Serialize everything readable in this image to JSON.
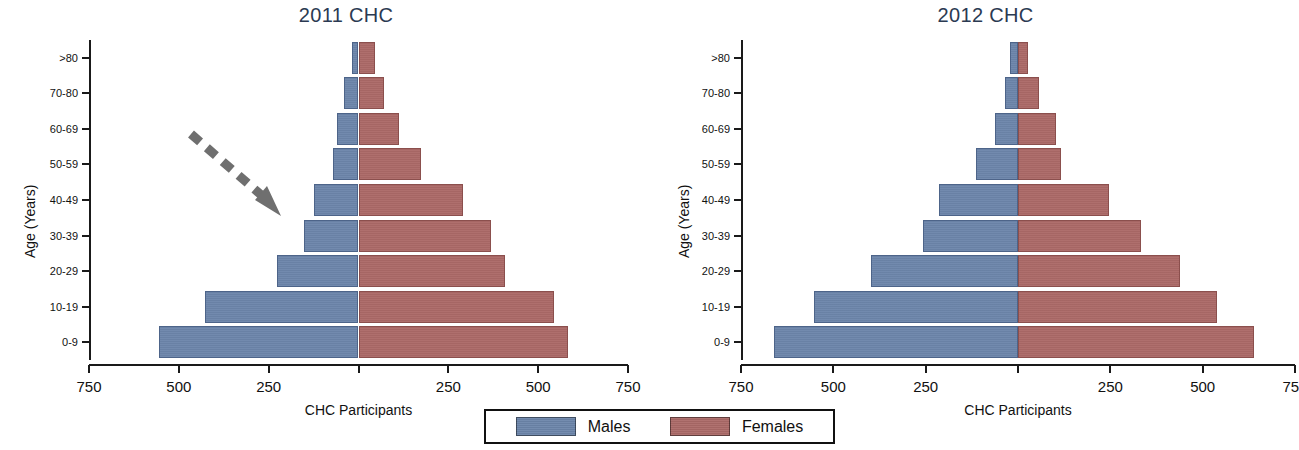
{
  "figure": {
    "xlabel": "CHC Participants",
    "ylabel": "Age (Years)"
  },
  "legend": {
    "items": [
      {
        "label": "Males",
        "color": "#6d86ab"
      },
      {
        "label": "Females",
        "color": "#ac6a68"
      }
    ]
  },
  "annotation": {
    "arrow": "dashed-arrow-pointing-down-right"
  },
  "panels": [
    {
      "title": "2011 CHC"
    },
    {
      "title": "2012 CHC"
    }
  ],
  "chart_data": [
    {
      "type": "bar",
      "title": "2011 CHC",
      "subtype": "population-pyramid",
      "xlabel": "CHC Participants",
      "ylabel": "Age (Years)",
      "categories": [
        "0-9",
        "10-19",
        "20-29",
        "30-39",
        "40-49",
        "50-59",
        "60-69",
        "70-80",
        ">80"
      ],
      "xticks": [
        750,
        500,
        250,
        0,
        250,
        500,
        750
      ],
      "xtick_labels": [
        "750",
        "500",
        "250",
        "",
        "250",
        "500",
        "750"
      ],
      "xlim": [
        -750,
        750
      ],
      "grid": false,
      "series": [
        {
          "name": "Males",
          "color": "#6d86ab",
          "side": "left",
          "values": [
            554,
            426,
            228,
            153,
            125,
            72,
            61,
            39,
            17
          ]
        },
        {
          "name": "Females",
          "color": "#ac6a68",
          "side": "right",
          "values": [
            582,
            543,
            407,
            368,
            290,
            175,
            114,
            70,
            45
          ]
        }
      ]
    },
    {
      "type": "bar",
      "title": "2012 CHC",
      "subtype": "population-pyramid",
      "xlabel": "CHC Participants",
      "ylabel": "Age (Years)",
      "categories": [
        "0-9",
        "10-19",
        "20-29",
        "30-39",
        "40-49",
        "50-59",
        "60-69",
        "70-80",
        ">80"
      ],
      "xticks": [
        750,
        500,
        250,
        0,
        250,
        500,
        750
      ],
      "xtick_labels": [
        "750",
        "500",
        "250",
        "",
        "250",
        "500",
        "750"
      ],
      "xlim": [
        -750,
        750
      ],
      "grid": false,
      "series": [
        {
          "name": "Males",
          "color": "#6d86ab",
          "side": "left",
          "values": [
            660,
            551,
            397,
            257,
            214,
            114,
            62,
            35,
            22
          ]
        },
        {
          "name": "Females",
          "color": "#ac6a68",
          "side": "right",
          "values": [
            640,
            538,
            438,
            332,
            246,
            116,
            103,
            57,
            27
          ]
        }
      ]
    }
  ]
}
